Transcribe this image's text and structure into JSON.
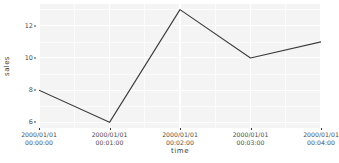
{
  "chart_data": {
    "type": "line",
    "title": "",
    "xlabel": "time",
    "ylabel": "sales",
    "x": [
      "2000/01/01 00:00:00",
      "2000/01/01 00:01:00",
      "2000/01/01 00:02:00",
      "2000/01/01 00:03:00",
      "2000/01/01 00:04:00"
    ],
    "values": [
      8,
      6,
      13,
      10,
      11
    ],
    "series": [
      {
        "name": "sales",
        "values": [
          8,
          6,
          13,
          10,
          11
        ]
      }
    ],
    "xlim": [
      0,
      4
    ],
    "ylim": [
      5.65,
      13.35
    ],
    "yticks": [
      6,
      8,
      10,
      12
    ],
    "yticklabels": [
      "6",
      "8",
      "10",
      "12"
    ],
    "xticks": [
      0,
      1,
      2,
      3,
      4
    ],
    "xticklabels": [
      {
        "line1": "2000/01/01",
        "line2": "00:00:00"
      },
      {
        "line1": "2000/01/01",
        "line2": "00:01:00"
      },
      {
        "line1": "2000/01/01",
        "line2": "00:02:00"
      },
      {
        "line1": "2000/01/01",
        "line2": "00:03:00"
      },
      {
        "line1": "2000/01/01",
        "line2": "00:04:00"
      }
    ],
    "yminor": [
      7,
      9,
      11,
      13
    ],
    "xminor": [
      0.5,
      1.5,
      2.5,
      3.5
    ],
    "grid": true,
    "legend": "none",
    "colors": {
      "line": "#3b3b3b",
      "panel_background": "#f4f4f4",
      "gridline": "#ffffff",
      "plot_background": "#ffffff",
      "text": "#4d4d4d"
    }
  }
}
